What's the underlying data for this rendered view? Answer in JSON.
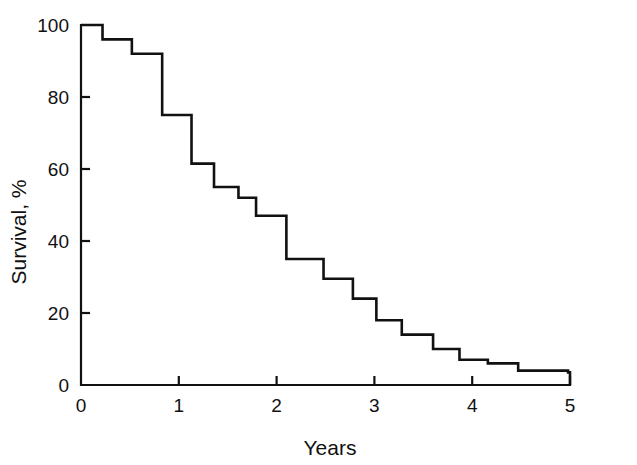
{
  "chart_data": {
    "type": "line",
    "subtype": "kaplan-meier-step",
    "title": "",
    "xlabel": "Years",
    "ylabel": "Survival, %",
    "xlim": [
      0,
      5
    ],
    "ylim": [
      0,
      100
    ],
    "grid": false,
    "legend": false,
    "x_ticks": [
      0,
      1,
      2,
      3,
      4,
      5
    ],
    "x_tick_labels": [
      "0",
      "1",
      "2",
      "3",
      "4",
      "5"
    ],
    "y_ticks": [
      0,
      20,
      40,
      60,
      80,
      100
    ],
    "y_tick_labels": [
      "0",
      "20",
      "40",
      "60",
      "80",
      "100"
    ],
    "line_color": "#111111",
    "background_color": "#ffffff",
    "x": [
      0.0,
      0.22,
      0.52,
      0.83,
      1.13,
      1.36,
      1.61,
      1.79,
      2.1,
      2.48,
      2.78,
      3.02,
      3.28,
      3.6,
      3.87,
      4.16,
      4.47,
      4.98
    ],
    "y": [
      100,
      96,
      92,
      75,
      61.5,
      55,
      52,
      47,
      35,
      29.5,
      24,
      18,
      14,
      10,
      7,
      6,
      4,
      3.5
    ],
    "steps": [
      {
        "x_start": 0.0,
        "x_end": 0.22,
        "survival": 100
      },
      {
        "x_start": 0.22,
        "x_end": 0.52,
        "survival": 96
      },
      {
        "x_start": 0.52,
        "x_end": 0.83,
        "survival": 92
      },
      {
        "x_start": 0.83,
        "x_end": 1.13,
        "survival": 75
      },
      {
        "x_start": 1.13,
        "x_end": 1.36,
        "survival": 61.5
      },
      {
        "x_start": 1.36,
        "x_end": 1.61,
        "survival": 55
      },
      {
        "x_start": 1.61,
        "x_end": 1.79,
        "survival": 52
      },
      {
        "x_start": 1.79,
        "x_end": 2.1,
        "survival": 47
      },
      {
        "x_start": 2.1,
        "x_end": 2.48,
        "survival": 35
      },
      {
        "x_start": 2.48,
        "x_end": 2.78,
        "survival": 29.5
      },
      {
        "x_start": 2.78,
        "x_end": 3.02,
        "survival": 24
      },
      {
        "x_start": 3.02,
        "x_end": 3.28,
        "survival": 18
      },
      {
        "x_start": 3.28,
        "x_end": 3.6,
        "survival": 14
      },
      {
        "x_start": 3.6,
        "x_end": 3.87,
        "survival": 10
      },
      {
        "x_start": 3.87,
        "x_end": 4.16,
        "survival": 7
      },
      {
        "x_start": 4.16,
        "x_end": 4.47,
        "survival": 6
      },
      {
        "x_start": 4.47,
        "x_end": 4.98,
        "survival": 4
      },
      {
        "x_start": 4.98,
        "x_end": 5.0,
        "survival": 3.5
      }
    ]
  },
  "axes": {
    "y_label": "Survival, %",
    "x_label": "Years",
    "y_tick_labels": [
      "100",
      "80",
      "60",
      "40",
      "20",
      "0"
    ],
    "x_tick_labels": [
      "0",
      "1",
      "2",
      "3",
      "4",
      "5"
    ]
  }
}
